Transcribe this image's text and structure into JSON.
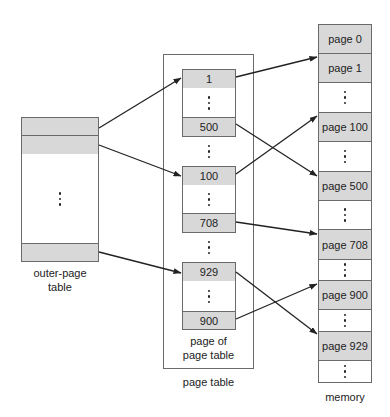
{
  "diagram": {
    "outer_page_table": {
      "label_line1": "outer-page",
      "label_line2": "table",
      "entries": [
        "",
        "",
        "⋮",
        ""
      ]
    },
    "page_table": {
      "label": "page table",
      "inner_label_line1": "page of",
      "inner_label_line2": "page table",
      "blocks": [
        {
          "top": "1",
          "bottom": "500"
        },
        {
          "top": "100",
          "bottom": "708"
        },
        {
          "top": "929",
          "bottom": "900"
        }
      ]
    },
    "memory": {
      "label": "memory",
      "pages": [
        "page 0",
        "page 1",
        "page 100",
        "page 500",
        "page 708",
        "page 900",
        "page 929"
      ]
    },
    "arrows": [
      {
        "from": "outer-page table entry 1",
        "to": "page table entry 1"
      },
      {
        "from": "outer-page table entry 2",
        "to": "page table entry 100"
      },
      {
        "from": "outer-page table last entry",
        "to": "page table entry 929"
      },
      {
        "from": "page table entry 1",
        "to": "page 1"
      },
      {
        "from": "page table entry 500",
        "to": "page 500"
      },
      {
        "from": "page table entry 100",
        "to": "page 100"
      },
      {
        "from": "page table entry 708",
        "to": "page 708"
      },
      {
        "from": "page table entry 929",
        "to": "page 929"
      },
      {
        "from": "page table entry 900",
        "to": "page 900"
      }
    ],
    "colors": {
      "cell_fill": "#d8d8d8",
      "border": "#6a6a6a",
      "arrow": "#222222"
    }
  }
}
